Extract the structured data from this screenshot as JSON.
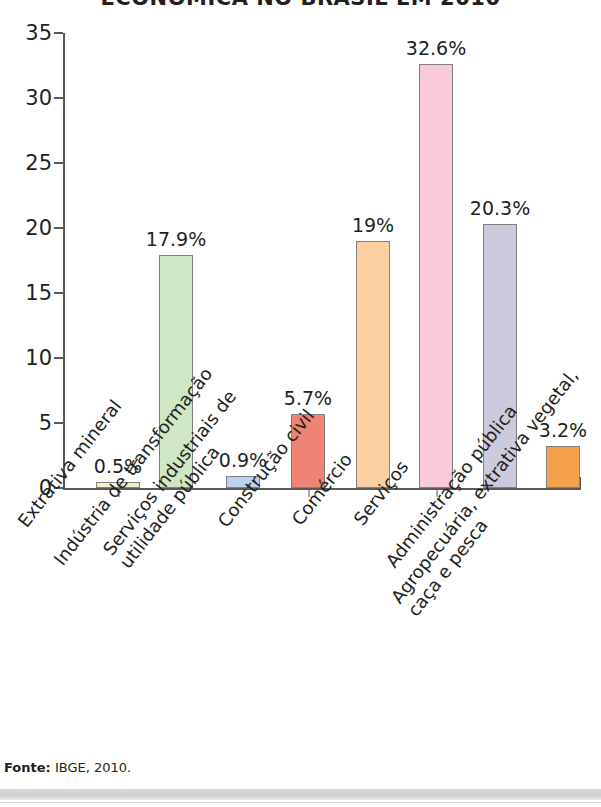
{
  "chart_data": {
    "type": "bar",
    "title": "ECONÔMICA NO BRASIL EM 2010",
    "xlabel": "",
    "ylabel": "",
    "ylim": [
      0,
      35
    ],
    "ytick_step": 5,
    "yticks": [
      "0",
      "5",
      "10",
      "15",
      "20",
      "25",
      "30",
      "35"
    ],
    "grid": false,
    "legend": "none",
    "categories": [
      "Extrativa mineral",
      "Indústria de transformação",
      "Serviços industriais de utilidade pública",
      "Construção civil",
      "Comércio",
      "Serviços",
      "Administração pública",
      "Agropecuária, extrativa vegetal, caça e pesca"
    ],
    "category_lines": [
      [
        "Extrativa mineral",
        ""
      ],
      [
        "Indústria de transformação",
        ""
      ],
      [
        "Serviços industriais de",
        "utilidade pública"
      ],
      [
        "Construção civil",
        ""
      ],
      [
        "Comércio",
        ""
      ],
      [
        "Serviços",
        ""
      ],
      [
        "Administração pública",
        ""
      ],
      [
        "Agropecuária, extrativa vegetal,",
        "caça e pesca"
      ]
    ],
    "values": [
      0.5,
      17.9,
      0.9,
      5.7,
      19,
      32.6,
      20.3,
      3.2
    ],
    "data_labels": [
      "0.5%",
      "17.9%",
      "0.9%",
      "5.7%",
      "19%",
      "32.6%",
      "20.3%",
      "3.2%"
    ],
    "bar_colors": [
      "#f4f0cf",
      "#cfe7c4",
      "#bdd0ec",
      "#ef8474",
      "#fbcfa2",
      "#f9c9d9",
      "#cecade",
      "#f5a04a"
    ],
    "bar_border_color": "#808080",
    "axis_color": "#58595b",
    "text_color": "#231f20"
  },
  "footer": {
    "source_label": "Fonte:",
    "source_value": "IBGE, 2010."
  }
}
